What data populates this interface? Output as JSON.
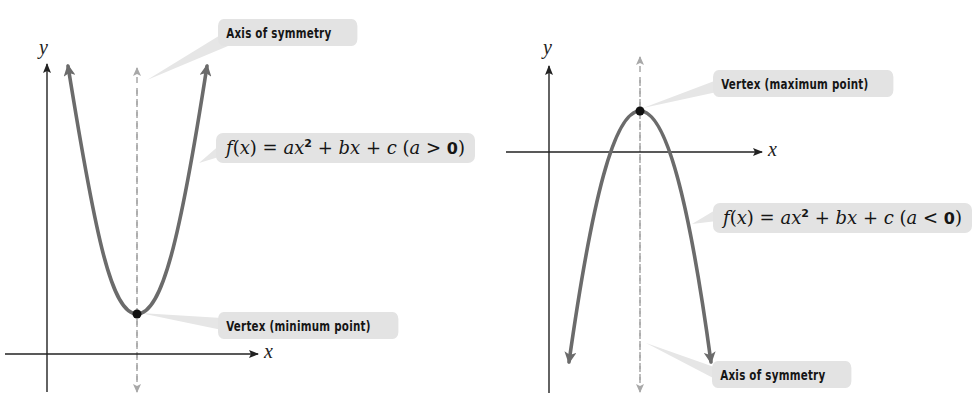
{
  "figures": [
    {
      "id": "upward-parabola",
      "axis_labels": {
        "x": "x",
        "y": "y"
      },
      "callouts": {
        "axis": "Axis of symmetry",
        "vertex": "Vertex (minimum point)",
        "formula": {
          "f": "f",
          "lparen": "(",
          "x": "x",
          "rparen_eq": ") = ",
          "a": "a",
          "x2": "x",
          "exp": "2",
          "plus_b": " + ",
          "b": "b",
          "x3": "x",
          "plus_c": " + ",
          "c": "c",
          "cond_open": " (",
          "cond_a": "a",
          "cond_op": " > ",
          "cond_zero": "0",
          "cond_close": ")"
        }
      }
    },
    {
      "id": "downward-parabola",
      "axis_labels": {
        "x": "x",
        "y": "y"
      },
      "callouts": {
        "axis": "Axis of symmetry",
        "vertex": "Vertex (maximum point)",
        "formula": {
          "f": "f",
          "lparen": "(",
          "x": "x",
          "rparen_eq": ") = ",
          "a": "a",
          "x2": "x",
          "exp": "2",
          "plus_b": " + ",
          "b": "b",
          "x3": "x",
          "plus_c": " + ",
          "c": "c",
          "cond_open": " (",
          "cond_a": "a",
          "cond_op": " < ",
          "cond_zero": "0",
          "cond_close": ")"
        }
      }
    }
  ],
  "colors": {
    "curve": "#6b6b6b",
    "axis": "#222222",
    "symmetry_line": "#a8a8a8",
    "callout_bg": "#e3e3e3",
    "vertex_dot": "#111111"
  }
}
